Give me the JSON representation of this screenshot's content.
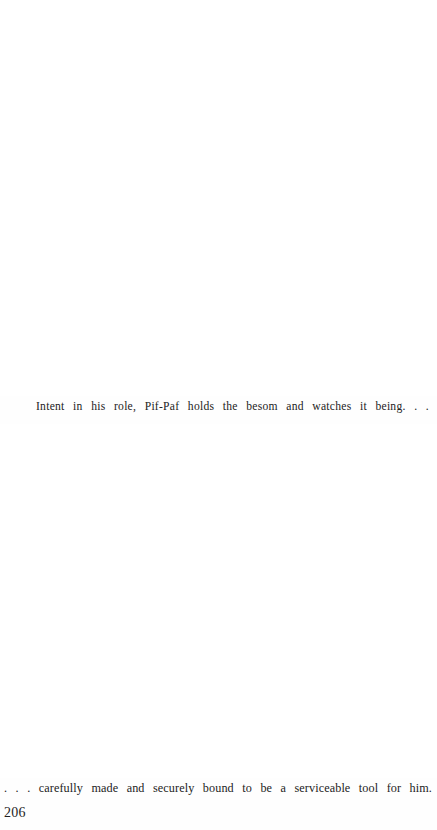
{
  "page": {
    "background_color": "#ffffff",
    "text_color": "#232323",
    "folio": "206",
    "plate_top_alt": "",
    "plate_bottom_alt": ""
  },
  "captions": {
    "top": "Intent in his role, Pif-Paf holds the besom and watches it being. . .",
    "bottom": ". . . carefully made and securely bound to be a serviceable tool for him."
  }
}
